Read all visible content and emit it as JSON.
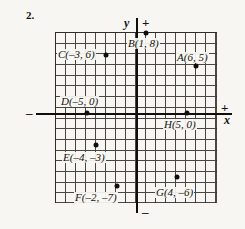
{
  "problem": {
    "number": "2."
  },
  "axes": {
    "y_label": "y",
    "x_label": "x",
    "plus_top": "+",
    "minus_bottom": "–",
    "plus_right": "+",
    "minus_left": "–"
  },
  "grid": {
    "cell_px": 10,
    "x_range": [
      -8,
      8
    ],
    "y_range": [
      -8,
      8
    ],
    "origin_px": {
      "x": 137,
      "y": 113
    }
  },
  "points": [
    {
      "name": "A",
      "label": "A(6, 5)",
      "x": 6,
      "y": 5,
      "dot_px": {
        "x": 196,
        "y": 66
      },
      "label_px": {
        "x": 176,
        "y": 52
      }
    },
    {
      "name": "B",
      "label": "B(1, 8)",
      "x": 1,
      "y": 8,
      "dot_px": {
        "x": 146,
        "y": 33
      },
      "label_px": {
        "x": 127,
        "y": 38
      }
    },
    {
      "name": "C",
      "label": "C(–3, 6)",
      "x": -3,
      "y": 6,
      "dot_px": {
        "x": 106,
        "y": 55
      },
      "label_px": {
        "x": 57,
        "y": 49
      }
    },
    {
      "name": "D",
      "label": "D(–5, 0)",
      "x": -5,
      "y": 0,
      "dot_px": {
        "x": 87,
        "y": 113
      },
      "label_px": {
        "x": 60,
        "y": 96
      }
    },
    {
      "name": "E",
      "label": "E(–4, –3)",
      "x": -4,
      "y": -3,
      "dot_px": {
        "x": 96,
        "y": 145
      },
      "label_px": {
        "x": 62,
        "y": 152
      }
    },
    {
      "name": "F",
      "label": "F(–2, –7)",
      "x": -2,
      "y": -7,
      "dot_px": {
        "x": 117,
        "y": 186
      },
      "label_px": {
        "x": 74,
        "y": 192
      }
    },
    {
      "name": "G",
      "label": "G(4, –6)",
      "x": 4,
      "y": -6,
      "dot_px": {
        "x": 177,
        "y": 177
      },
      "label_px": {
        "x": 155,
        "y": 187
      }
    },
    {
      "name": "H",
      "label": "H(5, 0)",
      "x": 5,
      "y": 0,
      "dot_px": {
        "x": 187,
        "y": 113
      },
      "label_px": {
        "x": 163,
        "y": 119
      }
    }
  ]
}
